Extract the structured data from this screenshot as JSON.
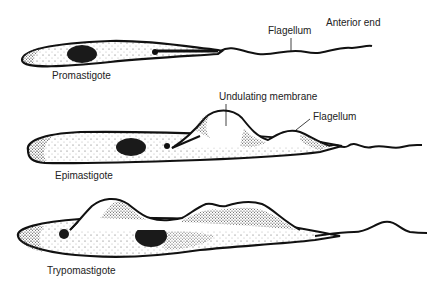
{
  "diagram": {
    "type": "biological-illustration",
    "colors": {
      "ink": "#111111",
      "background": "#ffffff",
      "label": "#222222"
    },
    "forms": [
      {
        "name": "Promastigote",
        "labels": {
          "form": "Promastigote",
          "flagellum": "Flagellum",
          "anterior": "Anterior end"
        }
      },
      {
        "name": "Epimastigote",
        "labels": {
          "form": "Epimastigote",
          "membrane": "Undulating membrane",
          "flagellum": "Flagellum"
        }
      },
      {
        "name": "Trypomastigote",
        "labels": {
          "form": "Trypomastigote"
        }
      }
    ]
  }
}
